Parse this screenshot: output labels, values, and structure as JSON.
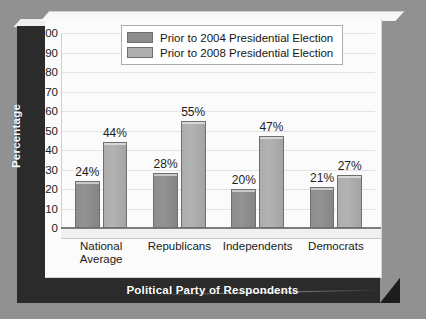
{
  "chart_data": {
    "type": "bar",
    "title": "",
    "xlabel": "Political Party of Respondents",
    "ylabel": "Percentage",
    "categories": [
      "National Average",
      "Republicans",
      "Independents",
      "Democrats"
    ],
    "series": [
      {
        "name": "Prior to 2004 Presidential Election",
        "values": [
          24,
          28,
          20,
          21
        ],
        "color": "#8d8d8d"
      },
      {
        "name": "Prior to 2008 Presidential Election",
        "values": [
          44,
          55,
          47,
          27
        ],
        "color": "#aeaeae"
      }
    ],
    "value_labels": [
      [
        "24%",
        "28%",
        "20%",
        "21%"
      ],
      [
        "44%",
        "55%",
        "47%",
        "27%"
      ]
    ],
    "ylim": [
      0,
      100
    ],
    "yticks": [
      0,
      10,
      20,
      30,
      40,
      50,
      60,
      70,
      80,
      90,
      100
    ],
    "ytick_labels": [
      "0",
      "10",
      "20",
      "30",
      "40",
      "50",
      "60",
      "70",
      "80",
      "90",
      "100"
    ],
    "grid": true,
    "legend_position": "top-left"
  },
  "legend": {
    "items": [
      {
        "label": "Prior to 2004 Presidential Election"
      },
      {
        "label": "Prior to 2008 Presidential Election"
      }
    ]
  },
  "axes": {
    "x_title": "Political Party of Respondents",
    "y_title": "Percentage"
  }
}
